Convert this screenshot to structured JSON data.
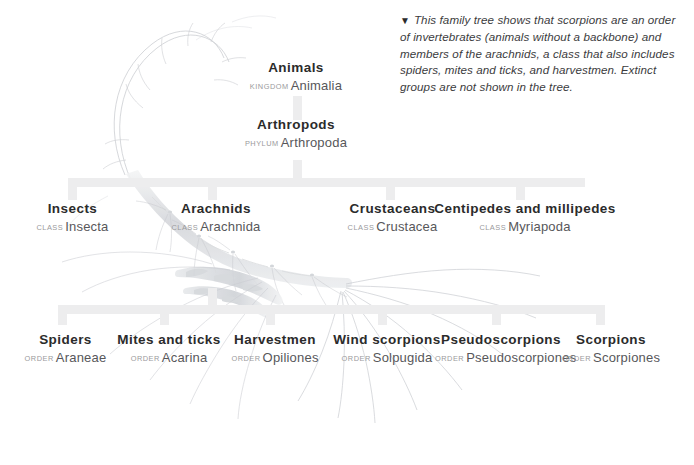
{
  "caption": {
    "marker": "▼",
    "text": "This family tree shows that scorpions are an order of invertebrates (animals without a backbone) and members of the arachnids, a class that also includes spiders, mites and ticks, and harvestmen. Extinct groups are not shown in the tree."
  },
  "colors": {
    "common_name": "#2b2b2b",
    "rank_label": "#9a9a9c",
    "scientific_name": "#57575a",
    "connector_bar": "#ededee",
    "background": "#ffffff",
    "watermark": "#b9bbc0"
  },
  "taxa": [
    {
      "common": "Animals",
      "rank": "KINGDOM",
      "sci": "Animalia",
      "level": "kingdom"
    },
    {
      "common": "Arthropods",
      "rank": "PHYLUM",
      "sci": "Arthropoda",
      "level": "phylum"
    },
    {
      "common": "Insects",
      "rank": "CLASS",
      "sci": "Insecta",
      "level": "class"
    },
    {
      "common": "Arachnids",
      "rank": "CLASS",
      "sci": "Arachnida",
      "level": "class"
    },
    {
      "common": "Crustaceans",
      "rank": "CLASS",
      "sci": "Crustacea",
      "level": "class"
    },
    {
      "common": "Centipedes and millipedes",
      "rank": "CLASS",
      "sci": "Myriapoda",
      "level": "class"
    },
    {
      "common": "Spiders",
      "rank": "ORDER",
      "sci": "Araneae",
      "level": "order"
    },
    {
      "common": "Mites and ticks",
      "rank": "ORDER",
      "sci": "Acarina",
      "level": "order"
    },
    {
      "common": "Harvestmen",
      "rank": "ORDER",
      "sci": "Opiliones",
      "level": "order"
    },
    {
      "common": "Wind scorpions",
      "rank": "ORDER",
      "sci": "Solpugida",
      "level": "order"
    },
    {
      "common": "Pseudoscorpions",
      "rank": "ORDER",
      "sci": "Pseudoscorpiones",
      "level": "order"
    },
    {
      "common": "Scorpions",
      "rank": "ORDER",
      "sci": "Scorpiones",
      "level": "order"
    }
  ],
  "watermark": {
    "subject": "scorpion",
    "parts": [
      "tail",
      "stinger",
      "body-segments",
      "pincers",
      "legs"
    ]
  }
}
